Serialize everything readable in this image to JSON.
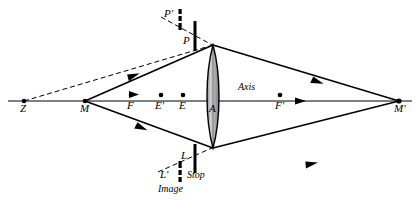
{
  "figure": {
    "kind": "optical-ray-diagram",
    "width": 420,
    "height": 206,
    "background_color": "#ffffff",
    "ink_color": "#000000",
    "lens_fill_color": "#b3b3b3",
    "axis_y": 101
  },
  "axis": {
    "label": "Axis",
    "label_x": 246,
    "label_y": 88,
    "start_x": 8,
    "end_x": 412,
    "arrow_marks": [
      {
        "x": 133,
        "y": 94
      },
      {
        "x": 300,
        "y": 101
      }
    ]
  },
  "points": [
    {
      "id": "Z",
      "label": "Z",
      "x": 24,
      "y": 101,
      "dot": true,
      "label_dx": -4,
      "label_dy": 6
    },
    {
      "id": "M",
      "label": "M",
      "x": 85,
      "y": 101,
      "dot": true,
      "label_dx": -5,
      "label_dy": 6
    },
    {
      "id": "F",
      "label": "F",
      "x": 131,
      "y": 95,
      "dot": true,
      "label_dx": -4,
      "label_dy": 7
    },
    {
      "id": "Ep",
      "label": "E'",
      "x": 161,
      "y": 95,
      "dot": true,
      "label_dx": -5,
      "label_dy": 7
    },
    {
      "id": "E",
      "label": "E",
      "x": 183,
      "y": 95,
      "dot": true,
      "label_dx": -4,
      "label_dy": 7
    },
    {
      "id": "A",
      "label": "A",
      "x": 213,
      "y": 101,
      "dot": false,
      "label_dx": -3,
      "label_dy": 8
    },
    {
      "id": "Fp",
      "label": "F'",
      "x": 280,
      "y": 101,
      "dot": true,
      "label_dx": -5,
      "label_dy": 7
    },
    {
      "id": "Mp",
      "label": "M'",
      "x": 399,
      "y": 101,
      "dot": true,
      "label_dx": -5,
      "label_dy": 8
    }
  ],
  "lens": {
    "name": "biconvex-lens",
    "center_x": 213,
    "top_y": 45,
    "bottom_y": 148,
    "half_width": 7,
    "fill": "#b3b3b3",
    "stroke": "#000000"
  },
  "stops": {
    "upper": {
      "solid_bar": {
        "name": "stop-bar-P",
        "x": 195,
        "y_top": 21,
        "y_bottom": 51,
        "width": 3
      },
      "dashed_bar": {
        "name": "image-bar-P-prime",
        "x": 180,
        "y_top": 9,
        "y_bottom": 30,
        "width": 3
      },
      "labels": [
        {
          "id": "P",
          "text": "P",
          "x": 184,
          "y": 40
        },
        {
          "id": "Pp",
          "text": "P'",
          "x": 165,
          "y": 14
        }
      ]
    },
    "lower": {
      "solid_bar": {
        "name": "stop-bar-L",
        "x": 195,
        "y_top": 144,
        "y_bottom": 173,
        "width": 3
      },
      "dashed_bar": {
        "name": "image-bar-L-prime",
        "x": 180,
        "y_top": 161,
        "y_bottom": 182,
        "width": 3
      },
      "labels": [
        {
          "id": "L",
          "text": "L",
          "x": 180,
          "y": 157
        },
        {
          "id": "Lp",
          "text": "L'",
          "x": 161,
          "y": 176
        },
        {
          "id": "Stop",
          "text": "Stop",
          "x": 188,
          "y": 176
        },
        {
          "id": "Image",
          "text": "Image",
          "x": 159,
          "y": 190
        }
      ]
    }
  },
  "rays": {
    "solid": [
      {
        "name": "ray-M-to-lens-top",
        "x1": 85,
        "y1": 101,
        "x2": 213,
        "y2": 45,
        "arrow_t": 0.42
      },
      {
        "name": "ray-M-to-lens-bottom",
        "x1": 85,
        "y1": 101,
        "x2": 213,
        "y2": 148,
        "arrow_t": 0.45
      },
      {
        "name": "ray-lenstop-to-Mprime",
        "x1": 213,
        "y1": 45,
        "x2": 399,
        "y2": 101,
        "arrow_t": 0.55
      },
      {
        "name": "ray-lensbot-to-Mprime",
        "x1": 213,
        "y1": 148,
        "x2": 399,
        "y2": 101,
        "arrow_t": 0.55
      }
    ],
    "dashed": [
      {
        "name": "virtual-ray-Z-to-lenstop",
        "x1": 24,
        "y1": 101,
        "x2": 213,
        "y2": 45
      },
      {
        "name": "virtual-ray-Pprime-chief",
        "x1": 163,
        "y1": 18,
        "x2": 213,
        "y2": 45
      },
      {
        "name": "virtual-ray-Lprime-chief",
        "x1": 160,
        "y1": 171,
        "x2": 213,
        "y2": 148
      }
    ]
  }
}
